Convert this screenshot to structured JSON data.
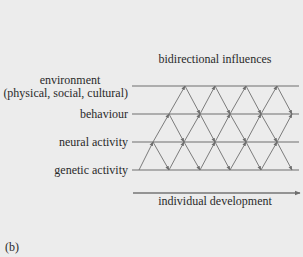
{
  "diagram": {
    "title": "bidirectional influences",
    "axis_label": "individual development",
    "panel_label": "(b)",
    "levels": [
      {
        "id": "environment",
        "label": "environment",
        "sublabel": "(physical, social, cultural)"
      },
      {
        "id": "behaviour",
        "label": "behaviour"
      },
      {
        "id": "neural",
        "label": "neural activity"
      },
      {
        "id": "genetic",
        "label": "genetic activity"
      }
    ],
    "colors": {
      "background": "#ececec",
      "line": "#6e6e6e",
      "text": "#2a2a2a"
    }
  }
}
